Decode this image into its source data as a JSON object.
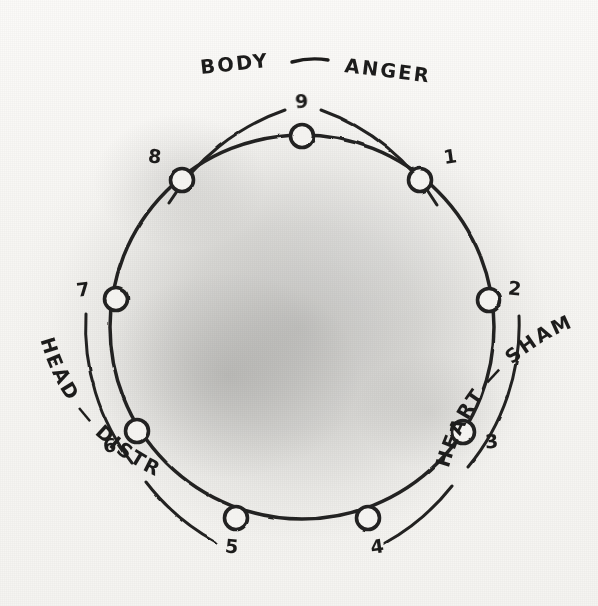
{
  "diagram": {
    "medium": "hand-drawn ink on aged paper",
    "ink_color": "#242220",
    "paper_color": "#f6f5f2",
    "circle": {
      "center_x": 302,
      "center_y": 327,
      "radius": 192
    },
    "points": [
      {
        "number": "1",
        "x": 420,
        "y": 180,
        "label_x": 451,
        "label_y": 163
      },
      {
        "number": "2",
        "x": 489,
        "y": 300,
        "label_x": 514,
        "label_y": 295
      },
      {
        "number": "3",
        "x": 463,
        "y": 432,
        "label_x": 492,
        "label_y": 448
      },
      {
        "number": "4",
        "x": 368,
        "y": 518,
        "label_x": 378,
        "label_y": 553
      },
      {
        "number": "5",
        "x": 236,
        "y": 518,
        "label_x": 231,
        "label_y": 553
      },
      {
        "number": "6",
        "x": 137,
        "y": 431,
        "label_x": 110,
        "label_y": 452
      },
      {
        "number": "7",
        "x": 116,
        "y": 299,
        "label_x": 84,
        "label_y": 296
      },
      {
        "number": "8",
        "x": 182,
        "y": 180,
        "label_x": 154,
        "label_y": 163
      },
      {
        "number": "9",
        "x": 302,
        "y": 136,
        "label_x": 302,
        "label_y": 108
      }
    ],
    "groups": [
      {
        "id": "body-anger",
        "center": "BODY",
        "emotion": "ANGER",
        "separator": "—",
        "position": "top",
        "covers_points": [
          "8",
          "9",
          "1"
        ]
      },
      {
        "id": "heart-shame",
        "center": "HEART",
        "emotion": "SHAME",
        "separator": "—",
        "position": "bottom-right",
        "covers_points": [
          "2",
          "3",
          "4"
        ]
      },
      {
        "id": "head-distress",
        "center": "HEAD",
        "emotion": "DISTRESS",
        "separator": "—",
        "position": "bottom-left",
        "covers_points": [
          "5",
          "6",
          "7"
        ]
      }
    ]
  }
}
